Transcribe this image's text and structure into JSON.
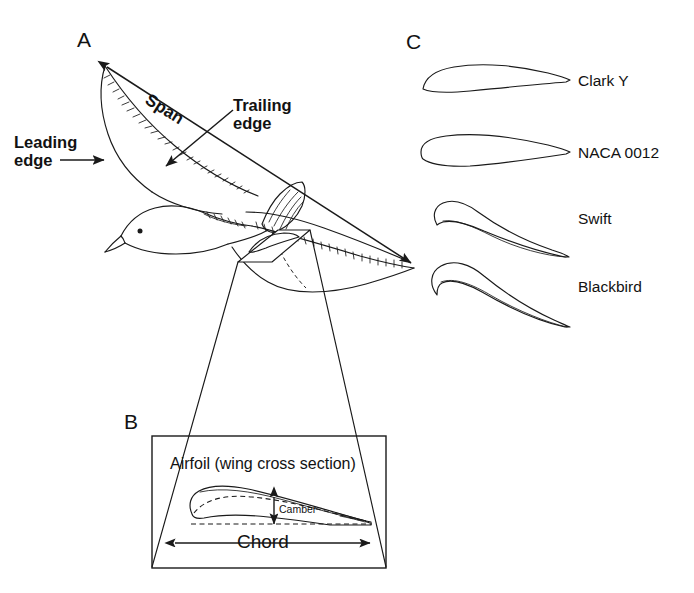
{
  "figure": {
    "background_color": "#ffffff",
    "ink_color": "#1a1a1a"
  },
  "panels": {
    "a": {
      "letter": "A",
      "subject": "gull in flight, line drawing",
      "callouts": [
        {
          "name": "span",
          "label": "Span",
          "note": "double-headed arrow wingtip to wingtip"
        },
        {
          "name": "trailing-edge",
          "label_line1": "Trailing",
          "label_line2": "edge",
          "note": "arrow to rear wing margin"
        },
        {
          "name": "leading-edge",
          "label_line1": "Leading",
          "label_line2": "edge",
          "note": "arrow to front wing margin"
        }
      ]
    },
    "b": {
      "letter": "B",
      "title": "Airfoil (wing cross section)",
      "dimensions": [
        {
          "name": "camber",
          "label": "Camber",
          "orientation": "vertical"
        },
        {
          "name": "chord",
          "label": "Chord",
          "orientation": "horizontal"
        }
      ]
    },
    "c": {
      "letter": "C",
      "airfoils": [
        {
          "name": "clark-y",
          "label": "Clark Y",
          "type": "cambered, flat lower surface"
        },
        {
          "name": "naca-0012",
          "label": "NACA 0012",
          "type": "symmetric"
        },
        {
          "name": "swift",
          "label": "Swift",
          "type": "thin, highly cambered"
        },
        {
          "name": "blackbird",
          "label": "Blackbird",
          "type": "thick, highly cambered"
        }
      ]
    }
  }
}
